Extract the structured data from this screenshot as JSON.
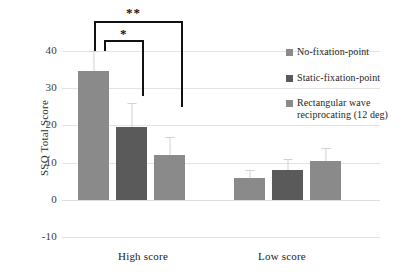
{
  "chart_data": {
    "type": "bar",
    "title": "",
    "xlabel": "",
    "ylabel": "SSQ Total Score",
    "categories": [
      "High score",
      "Low score"
    ],
    "ylim": [
      -10,
      40
    ],
    "yticks": [
      40,
      30,
      20,
      10,
      0,
      -10
    ],
    "ytick_labels": [
      "40",
      "30",
      "20",
      "10",
      "0",
      "-10"
    ],
    "grid": true,
    "legend_position": "right",
    "series": [
      {
        "name": "No-fixation-point",
        "color": "#8a8a8a",
        "values": [
          34.5,
          6.0
        ],
        "error_upper": [
          5.5,
          2.0
        ]
      },
      {
        "name": "Static-fixation-point",
        "color": "#5a5a5a",
        "values": [
          19.7,
          8.0
        ],
        "error_upper": [
          6.3,
          3.0
        ]
      },
      {
        "name": "Rectangular wave reciprocating (12 deg)",
        "color": "#8a8a8a",
        "values": [
          12.0,
          10.5
        ],
        "error_upper": [
          5.0,
          3.5
        ]
      }
    ],
    "annotations": [
      {
        "label": "*",
        "group": "High score",
        "from_series": 0,
        "to_series": 1
      },
      {
        "label": "**",
        "group": "High score",
        "from_series": 0,
        "to_series": 2
      }
    ]
  },
  "legend": {
    "items": [
      {
        "label": "No-fixation-point"
      },
      {
        "label": "Static-fixation-point"
      },
      {
        "label": "Rectangular wave reciprocating (12 deg)"
      }
    ]
  },
  "axis": {
    "y_title": "SSQ Total Score",
    "y_ticks": [
      "40",
      "30",
      "20",
      "10",
      "0",
      "-10"
    ],
    "x_labels": [
      "High score",
      "Low score"
    ]
  },
  "significance": {
    "single": "*",
    "double": "**"
  },
  "colors": {
    "series_light": "#8a8a8a",
    "series_dark": "#5a5a5a",
    "gridline": "#e3e3e3",
    "error_bar": "#d2d2d2",
    "bracket": "#111111",
    "background": "#ffffff"
  }
}
